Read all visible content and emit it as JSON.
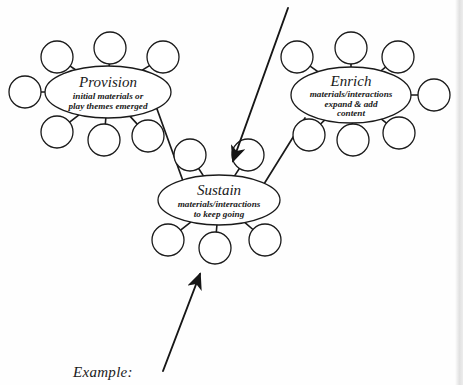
{
  "canvas": {
    "width": 463,
    "height": 385,
    "background": "#fefefe",
    "ink_color": "#1a1a1a",
    "stroke_width": 1.3
  },
  "diagram": {
    "type": "concept-map",
    "nodes": [
      {
        "id": "provision",
        "title": "Provision",
        "description_lines": [
          "initial materials or",
          "play themes emerged"
        ],
        "center": {
          "x": 108,
          "y": 92
        },
        "rx": 63,
        "ry": 26,
        "satellites": [
          {
            "id": "provision-sat-1",
            "x": 57,
            "y": 57,
            "r": 16
          },
          {
            "id": "provision-sat-2",
            "x": 110,
            "y": 48,
            "r": 16
          },
          {
            "id": "provision-sat-3",
            "x": 163,
            "y": 57,
            "r": 16
          },
          {
            "id": "provision-sat-4",
            "x": 25,
            "y": 92,
            "r": 16
          },
          {
            "id": "provision-sat-5",
            "x": 57,
            "y": 132,
            "r": 16
          },
          {
            "id": "provision-sat-6",
            "x": 104,
            "y": 140,
            "r": 16
          },
          {
            "id": "provision-sat-7",
            "x": 148,
            "y": 136,
            "r": 16
          }
        ]
      },
      {
        "id": "enrich",
        "title": "Enrich",
        "description_lines": [
          "materials/interactions",
          "expand & add",
          "content"
        ],
        "center": {
          "x": 351,
          "y": 95
        },
        "rx": 60,
        "ry": 28,
        "satellites": [
          {
            "id": "enrich-sat-1",
            "x": 297,
            "y": 57,
            "r": 16
          },
          {
            "id": "enrich-sat-2",
            "x": 351,
            "y": 48,
            "r": 16
          },
          {
            "id": "enrich-sat-3",
            "x": 398,
            "y": 57,
            "r": 16
          },
          {
            "id": "enrich-sat-4",
            "x": 434,
            "y": 95,
            "r": 16
          },
          {
            "id": "enrich-sat-5",
            "x": 309,
            "y": 135,
            "r": 16
          },
          {
            "id": "enrich-sat-6",
            "x": 353,
            "y": 140,
            "r": 16
          },
          {
            "id": "enrich-sat-7",
            "x": 399,
            "y": 133,
            "r": 16
          }
        ]
      },
      {
        "id": "sustain",
        "title": "Sustain",
        "description_lines": [
          "materials/interactions",
          "to keep going"
        ],
        "center": {
          "x": 219,
          "y": 200
        },
        "rx": 61,
        "ry": 25,
        "satellites": [
          {
            "id": "sustain-sat-1",
            "x": 190,
            "y": 155,
            "r": 16
          },
          {
            "id": "sustain-sat-2",
            "x": 248,
            "y": 155,
            "r": 16
          },
          {
            "id": "sustain-sat-3",
            "x": 168,
            "y": 240,
            "r": 16
          },
          {
            "id": "sustain-sat-4",
            "x": 215,
            "y": 248,
            "r": 16
          },
          {
            "id": "sustain-sat-5",
            "x": 265,
            "y": 240,
            "r": 16
          }
        ]
      }
    ],
    "links": [
      {
        "id": "provision-to-sustain",
        "from": "provision",
        "to": "sustain",
        "x1": 157,
        "y1": 109,
        "x2": 183,
        "y2": 181
      },
      {
        "id": "enrich-to-sustain",
        "from": "enrich",
        "to": "sustain",
        "x1": 305,
        "y1": 118,
        "x2": 264,
        "y2": 184
      }
    ],
    "arrows": [
      {
        "id": "arrow-to-sustain-top",
        "x1": 288,
        "y1": 8,
        "x2": 233,
        "y2": 161,
        "direction": "down-left"
      },
      {
        "id": "arrow-example-to-sustain",
        "x1": 163,
        "y1": 371,
        "x2": 200,
        "y2": 274,
        "direction": "up-right"
      }
    ]
  },
  "caption": {
    "example_label": "Example:",
    "x": 73,
    "y": 364
  }
}
